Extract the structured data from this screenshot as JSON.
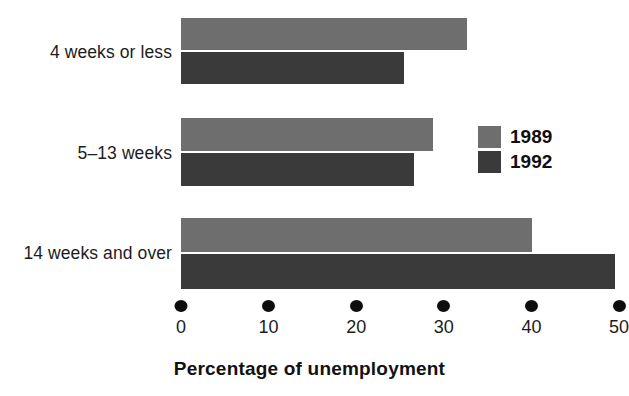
{
  "chart_data": {
    "type": "bar",
    "orientation": "horizontal",
    "title": "",
    "xlabel": "Percentage of unemployment",
    "ylabel": "",
    "categories": [
      "4 weeks or less",
      "5–13 weeks",
      "14 weeks and over"
    ],
    "series": [
      {
        "name": "1989",
        "color": "#6e6e6e",
        "values": [
          32.7,
          28.8,
          40.1
        ]
      },
      {
        "name": "1992",
        "color": "#3a3a3a",
        "values": [
          25.4,
          26.6,
          49.6
        ]
      }
    ],
    "xlim": [
      0,
      50
    ],
    "xticks": [
      0,
      10,
      20,
      30,
      40,
      50
    ],
    "xtick_labels": [
      "0",
      "10",
      "20",
      "30",
      "40",
      "50"
    ],
    "grid": false,
    "legend_position": "middle-right",
    "background_color": "#ffffff",
    "tick_marker": "filled-circle"
  },
  "axis": {
    "title": "Percentage of unemployment",
    "ticks": [
      {
        "label": "0",
        "value": 0
      },
      {
        "label": "10",
        "value": 10
      },
      {
        "label": "20",
        "value": 20
      },
      {
        "label": "30",
        "value": 30
      },
      {
        "label": "40",
        "value": 40
      },
      {
        "label": "50",
        "value": 50
      }
    ]
  },
  "categories": [
    {
      "label": "4 weeks or less"
    },
    {
      "label": "5–13 weeks"
    },
    {
      "label": "14 weeks and over"
    }
  ],
  "legend": {
    "entries": [
      {
        "label": "1989",
        "color": "#6e6e6e"
      },
      {
        "label": "1992",
        "color": "#3a3a3a"
      }
    ]
  }
}
